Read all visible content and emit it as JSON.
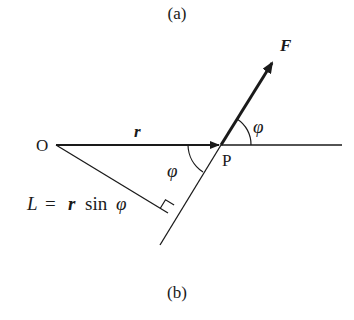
{
  "captions": {
    "top": "(a)",
    "bottom": "(b)"
  },
  "labels": {
    "origin": "O",
    "point": "P",
    "force": "F",
    "position_vector": "r",
    "angle_upper": "φ",
    "angle_lower": "φ",
    "lever_arm_eq_lhs": "L",
    "lever_arm_eq_eq": "=",
    "lever_arm_eq_r": "r",
    "lever_arm_eq_sin": "sin",
    "lever_arm_eq_phi": "φ"
  },
  "colors": {
    "stroke": "#1a1a1a",
    "background": "#ffffff"
  },
  "geometry": {
    "O": [
      54,
      145
    ],
    "P": [
      221,
      145
    ],
    "F_tip": [
      274,
      60
    ],
    "line_end_right": [
      342,
      145
    ],
    "line_end_lower": [
      160,
      245
    ],
    "perp_foot": [
      168,
      213
    ]
  }
}
